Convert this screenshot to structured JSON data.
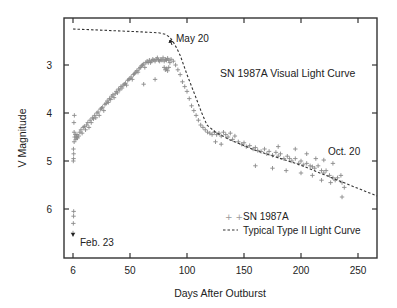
{
  "chart_data": {
    "type": "scatter",
    "title": "SN 1987A Visual Light Curve",
    "xlabel": "Days After Outburst",
    "ylabel": "V Magnitude",
    "xlim": [
      -8,
      267
    ],
    "ylim": [
      7.0,
      2.0
    ],
    "y_inverted": true,
    "grid": false,
    "x_ticks": [
      0,
      50,
      100,
      150,
      200,
      250
    ],
    "x_tick_labels": [
      "6",
      "50",
      "100",
      "150",
      "200",
      "250"
    ],
    "y_ticks": [
      3,
      4,
      5,
      6
    ],
    "y_tick_labels": [
      "3",
      "4",
      "5",
      "6"
    ],
    "legend_position": "lower right",
    "annotations": [
      {
        "text": "May 20",
        "x": 86,
        "y": 2.55,
        "arrow": true
      },
      {
        "text": "Oct. 20",
        "x": 240,
        "y": 4.9,
        "arrow": false
      },
      {
        "text": "Feb. 23",
        "x": 0,
        "y": 6.5,
        "arrow": true
      }
    ],
    "series": [
      {
        "name": "SN 1987A",
        "marker": "+",
        "color": "#8a8a8a",
        "points": [
          [
            0,
            6.5
          ],
          [
            0.3,
            6.3
          ],
          [
            0.5,
            6.15
          ],
          [
            0.6,
            6.05
          ],
          [
            0.3,
            5.0
          ],
          [
            0.5,
            4.95
          ],
          [
            0.6,
            4.85
          ],
          [
            0.4,
            4.75
          ],
          [
            1,
            4.6
          ],
          [
            1.5,
            4.5
          ],
          [
            1,
            4.4
          ],
          [
            2,
            4.45
          ],
          [
            0.8,
            4.2
          ],
          [
            1.2,
            4.05
          ],
          [
            2.5,
            4.55
          ],
          [
            3,
            4.5
          ],
          [
            3.5,
            4.45
          ],
          [
            4,
            4.52
          ],
          [
            5,
            4.48
          ],
          [
            6,
            4.4
          ],
          [
            7,
            4.35
          ],
          [
            8,
            4.42
          ],
          [
            9,
            4.3
          ],
          [
            10,
            4.28
          ],
          [
            11,
            4.35
          ],
          [
            12,
            4.25
          ],
          [
            13,
            4.2
          ],
          [
            14,
            4.3
          ],
          [
            15,
            4.15
          ],
          [
            16,
            4.2
          ],
          [
            17,
            4.1
          ],
          [
            18,
            4.12
          ],
          [
            19,
            4.05
          ],
          [
            20,
            4.1
          ],
          [
            21,
            4.0
          ],
          [
            22,
            3.98
          ],
          [
            23,
            4.05
          ],
          [
            24,
            3.92
          ],
          [
            25,
            3.9
          ],
          [
            26,
            3.88
          ],
          [
            27,
            3.95
          ],
          [
            28,
            3.82
          ],
          [
            29,
            3.8
          ],
          [
            30,
            3.75
          ],
          [
            31,
            3.78
          ],
          [
            32,
            3.7
          ],
          [
            33,
            3.72
          ],
          [
            34,
            3.65
          ],
          [
            35,
            3.62
          ],
          [
            36,
            3.68
          ],
          [
            37,
            3.6
          ],
          [
            38,
            3.55
          ],
          [
            39,
            3.58
          ],
          [
            40,
            3.5
          ],
          [
            41,
            3.52
          ],
          [
            42,
            3.45
          ],
          [
            43,
            3.48
          ],
          [
            44,
            3.42
          ],
          [
            45,
            3.4
          ],
          [
            46,
            3.38
          ],
          [
            47,
            3.42
          ],
          [
            48,
            3.32
          ],
          [
            49,
            3.3
          ],
          [
            50,
            3.28
          ],
          [
            51,
            3.25
          ],
          [
            52,
            3.3
          ],
          [
            53,
            3.2
          ],
          [
            54,
            3.18
          ],
          [
            55,
            3.15
          ],
          [
            56,
            3.12
          ],
          [
            57,
            3.15
          ],
          [
            58,
            3.08
          ],
          [
            59,
            3.05
          ],
          [
            60,
            3.02
          ],
          [
            61,
            3.0
          ],
          [
            62,
            2.98
          ],
          [
            63,
            3.05
          ],
          [
            64,
            2.95
          ],
          [
            65,
            2.92
          ],
          [
            66,
            2.95
          ],
          [
            67,
            2.9
          ],
          [
            68,
            2.95
          ],
          [
            69,
            2.92
          ],
          [
            70,
            2.88
          ],
          [
            71,
            2.9
          ],
          [
            72,
            2.92
          ],
          [
            73,
            2.88
          ],
          [
            74,
            2.85
          ],
          [
            75,
            2.9
          ],
          [
            76,
            2.92
          ],
          [
            77,
            2.88
          ],
          [
            78,
            2.9
          ],
          [
            79,
            2.85
          ],
          [
            80,
            2.92
          ],
          [
            81,
            2.88
          ],
          [
            82,
            2.9
          ],
          [
            83,
            2.86
          ],
          [
            84,
            2.9
          ],
          [
            85,
            2.95
          ],
          [
            86,
            2.88
          ],
          [
            80,
            3.05
          ],
          [
            81,
            3.1
          ],
          [
            82,
            3.08
          ],
          [
            83,
            3.12
          ],
          [
            84,
            3.05
          ],
          [
            72,
            3.3
          ],
          [
            62,
            3.4
          ],
          [
            88,
            2.92
          ],
          [
            90,
            3.0
          ],
          [
            92,
            3.1
          ],
          [
            94,
            3.2
          ],
          [
            96,
            3.35
          ],
          [
            98,
            3.45
          ],
          [
            100,
            3.55
          ],
          [
            102,
            3.7
          ],
          [
            104,
            3.85
          ],
          [
            106,
            3.95
          ],
          [
            108,
            4.05
          ],
          [
            110,
            4.15
          ],
          [
            112,
            4.25
          ],
          [
            114,
            4.3
          ],
          [
            116,
            4.35
          ],
          [
            118,
            4.4
          ],
          [
            120,
            4.42
          ],
          [
            122,
            4.45
          ],
          [
            124,
            4.4
          ],
          [
            126,
            4.45
          ],
          [
            128,
            4.42
          ],
          [
            130,
            4.48
          ],
          [
            132,
            4.4
          ],
          [
            134,
            4.45
          ],
          [
            136,
            4.5
          ],
          [
            138,
            4.42
          ],
          [
            140,
            4.55
          ],
          [
            142,
            4.48
          ],
          [
            125,
            4.6
          ],
          [
            130,
            4.65
          ],
          [
            145,
            4.6
          ],
          [
            148,
            4.65
          ],
          [
            150,
            4.62
          ],
          [
            152,
            4.7
          ],
          [
            155,
            4.68
          ],
          [
            158,
            4.75
          ],
          [
            160,
            4.72
          ],
          [
            162,
            4.78
          ],
          [
            165,
            4.8
          ],
          [
            168,
            4.75
          ],
          [
            170,
            4.85
          ],
          [
            172,
            4.8
          ],
          [
            175,
            4.88
          ],
          [
            178,
            4.82
          ],
          [
            180,
            4.9
          ],
          [
            182,
            4.85
          ],
          [
            185,
            4.95
          ],
          [
            188,
            4.9
          ],
          [
            190,
            4.95
          ],
          [
            192,
            5.0
          ],
          [
            195,
            4.95
          ],
          [
            198,
            5.05
          ],
          [
            200,
            5.0
          ],
          [
            202,
            5.08
          ],
          [
            205,
            5.05
          ],
          [
            208,
            5.1
          ],
          [
            210,
            5.12
          ],
          [
            212,
            5.15
          ],
          [
            215,
            5.1
          ],
          [
            218,
            5.2
          ],
          [
            220,
            5.25
          ],
          [
            222,
            5.2
          ],
          [
            225,
            5.3
          ],
          [
            228,
            5.35
          ],
          [
            230,
            5.4
          ],
          [
            232,
            5.35
          ],
          [
            235,
            5.3
          ],
          [
            236,
            5.45
          ],
          [
            238,
            5.55
          ],
          [
            160,
            5.1
          ],
          [
            175,
            5.15
          ],
          [
            187,
            5.2
          ],
          [
            200,
            5.25
          ],
          [
            210,
            5.3
          ],
          [
            218,
            5.4
          ],
          [
            226,
            5.45
          ],
          [
            236,
            5.75
          ],
          [
            180,
            4.7
          ],
          [
            195,
            4.75
          ],
          [
            205,
            4.85
          ],
          [
            213,
            4.95
          ],
          [
            220,
            4.98
          ],
          [
            228,
            5.05
          ]
        ]
      },
      {
        "name": "Typical Type II Light Curve",
        "style": "dashed",
        "color": "#333333",
        "points": [
          [
            0,
            2.25
          ],
          [
            30,
            2.28
          ],
          [
            60,
            2.31
          ],
          [
            75,
            2.33
          ],
          [
            81,
            2.36
          ],
          [
            85,
            2.42
          ],
          [
            88,
            2.52
          ],
          [
            91,
            2.65
          ],
          [
            94,
            2.8
          ],
          [
            100,
            3.2
          ],
          [
            107,
            3.63
          ],
          [
            113,
            4.0
          ],
          [
            117.5,
            4.25
          ],
          [
            125,
            4.4
          ],
          [
            137.7,
            4.56
          ],
          [
            160,
            4.78
          ],
          [
            199,
            5.08
          ],
          [
            230,
            5.38
          ],
          [
            266.7,
            5.73
          ]
        ]
      }
    ]
  },
  "legend": {
    "items": [
      {
        "label": "SN 1987A",
        "symbol": "+ +"
      },
      {
        "label": "Typical Type II Light Curve",
        "symbol": "- - -"
      }
    ]
  }
}
